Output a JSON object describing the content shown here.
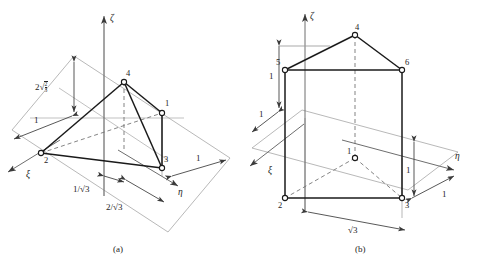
{
  "figure": {
    "type": "engineering-diagram",
    "panels": [
      {
        "id": "a",
        "caption": "(a)",
        "shape": "tetrahedron",
        "axes": [
          {
            "name": "zeta",
            "label": "ζ"
          },
          {
            "name": "xi",
            "label": "ξ"
          },
          {
            "name": "eta",
            "label": "η"
          }
        ],
        "nodes": [
          {
            "id": "1",
            "label": "1"
          },
          {
            "id": "2",
            "label": "2"
          },
          {
            "id": "3",
            "label": "3"
          },
          {
            "id": "4",
            "label": "4"
          }
        ],
        "dimensions": [
          {
            "id": "height",
            "label_prefix": "2",
            "radical": true,
            "num": "2",
            "den": "3",
            "plain": "2√(2/3)"
          },
          {
            "id": "left-edge",
            "label": "1",
            "plain": "1"
          },
          {
            "id": "right-edge",
            "label": "1",
            "plain": "1"
          },
          {
            "id": "one-over-root3",
            "label": "1/√3",
            "plain": "1/√3"
          },
          {
            "id": "two-over-root3",
            "label": "2/√3",
            "plain": "2/√3"
          }
        ]
      },
      {
        "id": "b",
        "caption": "(b)",
        "shape": "triangular-prism",
        "axes": [
          {
            "name": "zeta",
            "label": "ζ"
          },
          {
            "name": "xi",
            "label": "ξ"
          },
          {
            "name": "eta",
            "label": "η"
          }
        ],
        "nodes": [
          {
            "id": "1",
            "label": "1"
          },
          {
            "id": "2",
            "label": "2"
          },
          {
            "id": "3",
            "label": "3"
          },
          {
            "id": "4",
            "label": "4"
          },
          {
            "id": "5",
            "label": "5"
          },
          {
            "id": "6",
            "label": "6"
          }
        ],
        "dimensions": [
          {
            "id": "upper-left",
            "label": "1",
            "plain": "1"
          },
          {
            "id": "lower-left",
            "label": "1",
            "plain": "1"
          },
          {
            "id": "right-vertical",
            "label": "1",
            "plain": "1"
          },
          {
            "id": "right-diagonal",
            "label": "1",
            "plain": "1"
          },
          {
            "id": "base-width",
            "label": "√3",
            "plain": "√3"
          }
        ]
      }
    ],
    "colors": {
      "solid_edge": "#1a1a1a",
      "construction_line": "#8d8d8d",
      "dashed_edge": "#6e6e6e",
      "node_fill": "#ffffff",
      "text": "#242424",
      "background": "#ffffff"
    }
  }
}
